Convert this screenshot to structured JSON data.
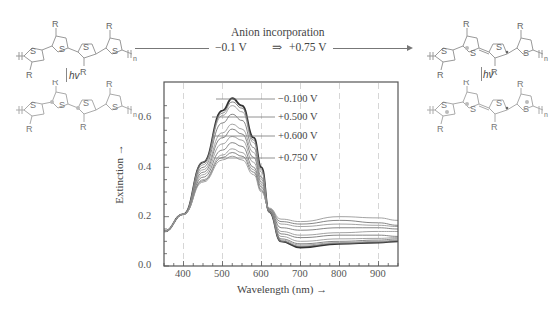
{
  "reaction": {
    "title": "Anion incorporation",
    "from_potential": "−0.1 V",
    "arrow": "⇒",
    "to_potential": "+0.75 V"
  },
  "molecules": {
    "substituent": "R",
    "heteroatom": "S",
    "repeat": "n",
    "photon_label": "hv"
  },
  "chart_data": {
    "type": "line",
    "title": "",
    "xlabel": "Wavelength (nm) →",
    "ylabel": "Extinction →",
    "xlim": [
      350,
      950
    ],
    "ylim": [
      0.0,
      0.72
    ],
    "xticks": [
      400,
      500,
      600,
      700,
      800,
      900
    ],
    "yticks": [
      0.0,
      0.2,
      0.4,
      0.6
    ],
    "ytick_labels": [
      "0.0",
      "0.2",
      "0.4",
      "0.6"
    ],
    "grid": "vertical dashed at x ticks",
    "annotations": [
      "−0.100 V",
      "+0.500 V",
      "+0.600 V",
      "+0.750 V"
    ],
    "x": [
      350,
      400,
      450,
      500,
      525,
      550,
      580,
      600,
      620,
      650,
      700,
      800,
      900,
      950
    ],
    "series": [
      {
        "name": "−0.100 V",
        "values": [
          0.14,
          0.21,
          0.42,
          0.63,
          0.68,
          0.65,
          0.52,
          0.4,
          0.22,
          0.1,
          0.075,
          0.09,
          0.095,
          0.1
        ]
      },
      {
        "name": "step 2",
        "values": [
          0.14,
          0.21,
          0.42,
          0.62,
          0.665,
          0.64,
          0.51,
          0.39,
          0.22,
          0.1,
          0.08,
          0.092,
          0.097,
          0.102
        ]
      },
      {
        "name": "step 3",
        "values": [
          0.14,
          0.21,
          0.41,
          0.61,
          0.65,
          0.625,
          0.5,
          0.38,
          0.22,
          0.105,
          0.085,
          0.095,
          0.1,
          0.105
        ]
      },
      {
        "name": "+0.500 V",
        "values": [
          0.14,
          0.21,
          0.4,
          0.58,
          0.615,
          0.59,
          0.48,
          0.36,
          0.22,
          0.11,
          0.09,
          0.1,
          0.105,
          0.11
        ]
      },
      {
        "name": "step 5",
        "values": [
          0.14,
          0.21,
          0.39,
          0.54,
          0.575,
          0.555,
          0.46,
          0.35,
          0.225,
          0.12,
          0.1,
          0.11,
          0.112,
          0.115
        ]
      },
      {
        "name": "step 6",
        "values": [
          0.14,
          0.21,
          0.38,
          0.52,
          0.555,
          0.535,
          0.44,
          0.34,
          0.225,
          0.13,
          0.115,
          0.125,
          0.125,
          0.12
        ]
      },
      {
        "name": "+0.600 V",
        "values": [
          0.14,
          0.21,
          0.37,
          0.495,
          0.525,
          0.51,
          0.42,
          0.33,
          0.23,
          0.14,
          0.125,
          0.135,
          0.14,
          0.14
        ]
      },
      {
        "name": "step 8",
        "values": [
          0.14,
          0.21,
          0.36,
          0.47,
          0.5,
          0.485,
          0.4,
          0.32,
          0.23,
          0.155,
          0.145,
          0.155,
          0.155,
          0.15
        ]
      },
      {
        "name": "step 9",
        "values": [
          0.14,
          0.21,
          0.35,
          0.45,
          0.475,
          0.46,
          0.39,
          0.31,
          0.23,
          0.17,
          0.16,
          0.17,
          0.165,
          0.16
        ]
      },
      {
        "name": "step 10",
        "values": [
          0.14,
          0.21,
          0.345,
          0.44,
          0.46,
          0.445,
          0.38,
          0.305,
          0.232,
          0.18,
          0.17,
          0.185,
          0.175,
          0.165
        ]
      },
      {
        "name": "+0.750 V",
        "values": [
          0.14,
          0.21,
          0.34,
          0.43,
          0.445,
          0.43,
          0.37,
          0.3,
          0.235,
          0.19,
          0.18,
          0.2,
          0.195,
          0.185
        ]
      }
    ]
  }
}
